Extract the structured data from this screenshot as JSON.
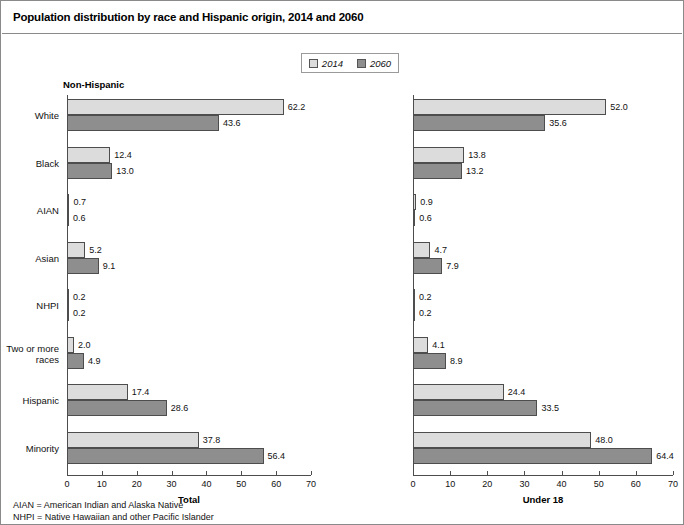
{
  "title": "Population distribution by race and Hispanic origin, 2014 and 2060",
  "legend": {
    "items": [
      {
        "label": "2014",
        "color": "#dcdcdc"
      },
      {
        "label": "2060",
        "color": "#8e8e8e"
      }
    ]
  },
  "panels": {
    "left": {
      "header": "Non-Hispanic",
      "axis_title": "Total"
    },
    "right": {
      "header": "",
      "axis_title": "Under 18"
    }
  },
  "footnotes": [
    "AIAN = American Indian and Alaska Native",
    "NHPI = Native Hawaiian and other Pacific Islander"
  ],
  "chart_data": {
    "type": "bar",
    "title": "Population distribution by race and Hispanic origin, 2014 and 2060",
    "orientation": "horizontal",
    "grid": false,
    "legend_position": "top-center",
    "categories": [
      "White",
      "Black",
      "AIAN",
      "Asian",
      "NHPI",
      "Two or more\nraces",
      "Hispanic",
      "Minority"
    ],
    "xlabel": "",
    "ylabel": "",
    "xlim": [
      0,
      70
    ],
    "xticks": [
      0,
      10,
      20,
      30,
      40,
      50,
      60,
      70
    ],
    "panels": [
      {
        "name": "Total",
        "header": "Non-Hispanic",
        "axis_title": "Total",
        "series": [
          {
            "name": "2014",
            "values": [
              62.2,
              12.4,
              0.7,
              5.2,
              0.2,
              2.0,
              17.4,
              37.8
            ]
          },
          {
            "name": "2060",
            "values": [
              43.6,
              13.0,
              0.6,
              9.1,
              0.2,
              4.9,
              28.6,
              56.4
            ]
          }
        ]
      },
      {
        "name": "Under 18",
        "header": "",
        "axis_title": "Under 18",
        "series": [
          {
            "name": "2014",
            "values": [
              52.0,
              13.8,
              0.9,
              4.7,
              0.2,
              4.1,
              24.4,
              48.0
            ]
          },
          {
            "name": "2060",
            "values": [
              35.6,
              13.2,
              0.6,
              7.9,
              0.2,
              8.9,
              33.5,
              64.4
            ]
          }
        ]
      }
    ]
  }
}
